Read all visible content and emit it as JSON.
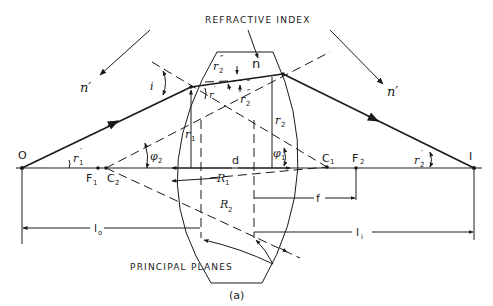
{
  "figure": {
    "caption": "(a)",
    "title_label": "REFRACTIVE INDEX",
    "principal_planes_label": "PRINCIPAL PLANES",
    "media": {
      "outer_left": "n′",
      "outer_right": "n′",
      "lens": "n"
    },
    "points": {
      "object": "O",
      "image": "I",
      "focal_1": "F",
      "focal_1_sub": "1",
      "focal_2": "F",
      "focal_2_sub": "2",
      "center_1": "C",
      "center_1_sub": "1",
      "center_2": "C",
      "center_2_sub": "2"
    },
    "angles": {
      "incidence": "i",
      "r1_prime": "r",
      "r1_prime_sub": "1",
      "r1_prime_mark": "′",
      "r_lens": "r",
      "r_lens_mark": "′",
      "r2_double_prime_a": "r",
      "r2_double_prime_a_sub": "2",
      "r2_double_prime_a_mark": "″",
      "r2_double_prime_b": "r",
      "r2_double_prime_b_sub": "2",
      "r2_double_prime_b_mark": "″",
      "r2_prime": "r",
      "r2_prime_sub": "2",
      "r2_prime_mark": "′",
      "phi1": "φ",
      "phi1_sub": "1",
      "phi2": "φ",
      "phi2_sub": "2"
    },
    "dimensions": {
      "height_1": "r",
      "height_1_sub": "1",
      "height_2": "r",
      "height_2_sub": "2",
      "thickness": "d",
      "radius_1": "R",
      "radius_1_sub": "1",
      "radius_2": "R",
      "radius_2_sub": "2",
      "focal_length": "f",
      "object_distance": "l",
      "object_distance_sub": "o",
      "image_distance": "l",
      "image_distance_sub": "i"
    }
  }
}
